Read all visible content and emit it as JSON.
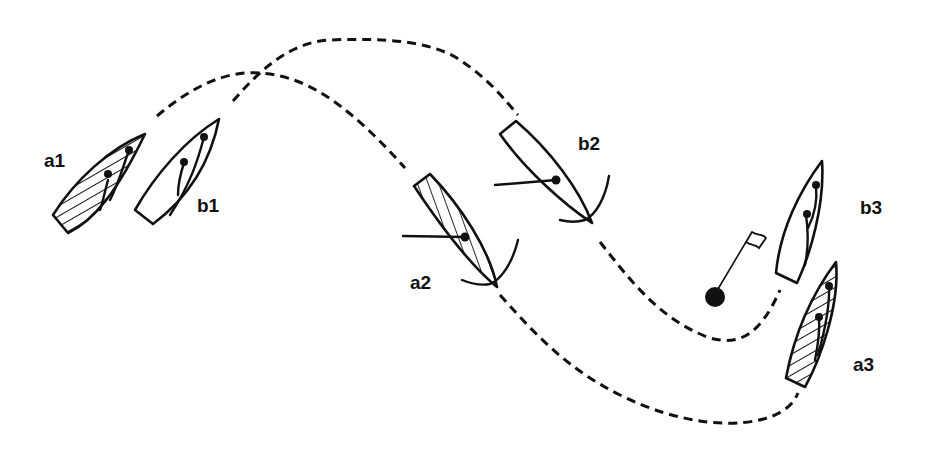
{
  "diagram": {
    "type": "sailing-tactics",
    "colors": {
      "ink": "#111111",
      "background": "#ffffff"
    },
    "boats": [
      {
        "id": "a1",
        "label": "a1",
        "style": "hatched",
        "position": "left",
        "heading": "up-right"
      },
      {
        "id": "b1",
        "label": "b1",
        "style": "plain",
        "position": "left",
        "heading": "up-right"
      },
      {
        "id": "a2",
        "label": "a2",
        "style": "hatched",
        "position": "center",
        "heading": "down-right (in tack, boom out)"
      },
      {
        "id": "b2",
        "label": "b2",
        "style": "plain",
        "position": "center-right",
        "heading": "down-right (in tack, boom out)"
      },
      {
        "id": "b3",
        "label": "b3",
        "style": "plain",
        "position": "right",
        "heading": "up"
      },
      {
        "id": "a3",
        "label": "a3",
        "style": "hatched",
        "position": "right",
        "heading": "up"
      }
    ],
    "mark": {
      "name": "mark-buoy",
      "has_flag": true
    },
    "tracks": [
      {
        "boat": "a",
        "from": "a1",
        "via": "a2",
        "to": "a3",
        "style": "dashed"
      },
      {
        "boat": "b",
        "from": "b1",
        "via": "b2",
        "to": "b3",
        "style": "dashed"
      }
    ]
  }
}
